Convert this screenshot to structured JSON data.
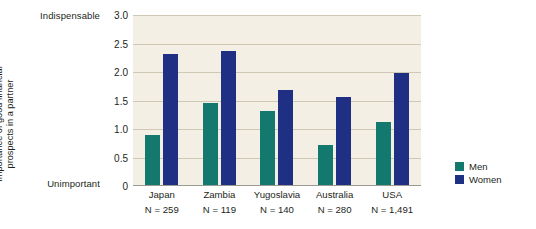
{
  "chart_data": {
    "type": "bar",
    "title": "",
    "xlabel": "",
    "ylabel": "Importance of good financial prospects in a partner",
    "ylabel_lines": [
      "Importance of good financial",
      "prospects in a partner"
    ],
    "ylim": [
      0,
      3.0
    ],
    "ytick_labels": [
      "0",
      "0.5",
      "1.0",
      "1.5",
      "2.0",
      "2.5",
      "3.0"
    ],
    "ytick_values": [
      0,
      0.5,
      1.0,
      1.5,
      2.0,
      2.5,
      3.0
    ],
    "y_axis_endpoint_labels": {
      "top": "Indispensable",
      "bottom": "Unimportant"
    },
    "grid": true,
    "legend_position": "right",
    "categories": [
      "Japan",
      "Zambia",
      "Yugoslavia",
      "Australia",
      "USA"
    ],
    "category_sample_sizes": [
      "N = 259",
      "N = 119",
      "N = 140",
      "N = 280",
      "N = 1,491"
    ],
    "series": [
      {
        "name": "Men",
        "color": "#13796f",
        "values": [
          0.9,
          1.46,
          1.31,
          0.72,
          1.13
        ]
      },
      {
        "name": "Women",
        "color": "#1e2f84",
        "values": [
          2.31,
          2.37,
          1.69,
          1.56,
          1.99
        ]
      }
    ],
    "plot_background_color": "#f3efe4",
    "gridline_color": "#cfc8b5",
    "axis_color": "#9a9a92",
    "text_color": "#231f20"
  }
}
